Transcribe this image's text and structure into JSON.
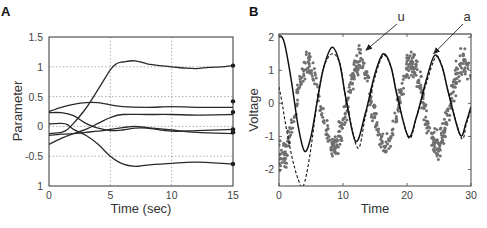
{
  "chart_data": [
    {
      "panel": "A",
      "type": "line",
      "title": "",
      "xlabel": "Time (sec)",
      "ylabel": "Parameter",
      "xlim": [
        0,
        15
      ],
      "ylim": [
        -1,
        1.5
      ],
      "xticks": [
        0,
        5,
        10,
        15
      ],
      "xtick_labels": [
        "0",
        "5",
        "10",
        "15"
      ],
      "yticks": [
        1.5,
        1,
        0.5,
        0,
        -0.5,
        -1
      ],
      "ytick_labels": [
        "1.5",
        "1",
        "0.5",
        "0",
        "-0.5",
        "1"
      ],
      "grid": true,
      "grid_style": "dotted",
      "legend": null,
      "series": [
        {
          "name": "param1",
          "x": [
            0,
            1,
            1.5,
            2,
            3,
            4,
            5,
            5.5,
            6,
            7,
            8,
            9,
            10,
            11,
            12,
            13,
            14,
            15
          ],
          "y": [
            -0.12,
            -0.1,
            -0.05,
            0.05,
            0.3,
            0.62,
            0.95,
            1.05,
            1.08,
            1.1,
            1.05,
            1.02,
            1.0,
            0.98,
            0.97,
            0.99,
            1.0,
            1.02
          ]
        },
        {
          "name": "param2",
          "x": [
            0,
            1,
            2,
            3,
            4,
            5,
            6,
            8,
            10,
            12,
            15
          ],
          "y": [
            0.25,
            0.32,
            0.37,
            0.4,
            0.4,
            0.36,
            0.33,
            0.32,
            0.33,
            0.32,
            0.32
          ]
        },
        {
          "name": "param3",
          "x": [
            0,
            1,
            2,
            3,
            4,
            5,
            6,
            8,
            10,
            12,
            15
          ],
          "y": [
            -0.3,
            -0.2,
            -0.12,
            -0.05,
            0.05,
            0.15,
            0.2,
            0.2,
            0.2,
            0.19,
            0.2
          ]
        },
        {
          "name": "param4",
          "x": [
            0,
            1,
            2,
            3,
            4,
            5,
            6,
            7,
            8,
            10,
            12,
            15
          ],
          "y": [
            0.23,
            0.23,
            0.18,
            0.05,
            -0.03,
            -0.07,
            -0.06,
            -0.03,
            -0.03,
            -0.08,
            -0.07,
            -0.05
          ]
        },
        {
          "name": "param5",
          "x": [
            0,
            1,
            2,
            3,
            4,
            5,
            6,
            7,
            8,
            10,
            12,
            15
          ],
          "y": [
            -0.15,
            -0.13,
            -0.12,
            -0.1,
            -0.08,
            -0.05,
            -0.02,
            0.0,
            -0.02,
            -0.06,
            -0.1,
            -0.12
          ]
        },
        {
          "name": "param6",
          "x": [
            0,
            1,
            1.5,
            2,
            3,
            4,
            5,
            6,
            7,
            8,
            10,
            12,
            15
          ],
          "y": [
            0.04,
            0.05,
            0.03,
            -0.05,
            -0.15,
            -0.3,
            -0.5,
            -0.63,
            -0.67,
            -0.65,
            -0.62,
            -0.6,
            -0.63
          ]
        }
      ],
      "end_markers": [
        1.02,
        0.42,
        0.24,
        -0.05,
        -0.1,
        -0.63
      ]
    },
    {
      "panel": "B",
      "type": "line+scatter",
      "title": "",
      "xlabel": "Time",
      "ylabel": "Voltage",
      "xlim": [
        0,
        30
      ],
      "ylim": [
        -2.5,
        2.1
      ],
      "xticks": [
        0,
        10,
        20,
        30
      ],
      "xtick_labels": [
        "0",
        "10",
        "20",
        "30"
      ],
      "yticks": [
        2,
        1,
        0,
        -1,
        -2
      ],
      "ytick_labels": [
        "2",
        "1",
        "0",
        "-1",
        "-2"
      ],
      "grid": false,
      "legend": null,
      "annotations": [
        {
          "text": "u",
          "label_xy": [
            401,
            17
          ],
          "arrow_to_data": [
            13.6,
            1.55
          ]
        },
        {
          "text": "a",
          "label_xy": [
            467,
            17
          ],
          "arrow_to_data": [
            24.2,
            1.45
          ]
        }
      ],
      "series": [
        {
          "name": "a (solid)",
          "style": "solid",
          "x": [
            0,
            0.5,
            1,
            2,
            3,
            4,
            5,
            6,
            7,
            8.3,
            9.5,
            10.5,
            12,
            13.5,
            15,
            16.3,
            17.5,
            18.5,
            20.2,
            21.5,
            23,
            24.3,
            25.5,
            26.5,
            28.3,
            29.2,
            30
          ],
          "y": [
            2.05,
            2.0,
            1.7,
            0.6,
            -0.7,
            -1.45,
            -1.0,
            0.1,
            1.1,
            1.7,
            1.2,
            0.1,
            -1.15,
            -0.3,
            0.9,
            1.5,
            1.1,
            0.2,
            -1.0,
            -0.4,
            0.7,
            1.45,
            1.1,
            0.3,
            -0.95,
            -0.6,
            -0.1
          ]
        },
        {
          "name": "u (dashed)",
          "style": "dashed",
          "x": [
            0,
            0.5,
            1,
            2,
            3,
            3.8,
            4.8,
            6,
            7,
            8.3,
            9.5,
            10.5,
            12.3,
            13.5,
            15,
            16.3,
            17.5,
            18.5,
            20.3,
            21.5,
            23,
            24.5,
            25.5,
            26.5,
            28.5,
            29.3,
            30
          ],
          "y": [
            0.5,
            0.0,
            -0.6,
            -1.6,
            -2.3,
            -2.5,
            -1.6,
            0.1,
            1.1,
            1.5,
            1.2,
            0.1,
            -1.35,
            -0.4,
            0.8,
            1.45,
            1.1,
            0.2,
            -1.05,
            -0.4,
            0.6,
            1.4,
            1.1,
            0.3,
            -1.05,
            -0.6,
            -0.2
          ]
        },
        {
          "name": "observed samples",
          "style": "scatter",
          "color": "#6f6f6f",
          "description": "dense noisy grey dots oscillating with period ~8, amplitude ~1.3, phase leading the solid curve by ~2 time units",
          "approx_model": "y = 1.25*sin(2*pi*(t-0.4)/8.1 - 1.6) + noise(sd~0.35)"
        }
      ]
    }
  ],
  "figure": {
    "panel_a_label": "A",
    "panel_b_label": "B"
  }
}
